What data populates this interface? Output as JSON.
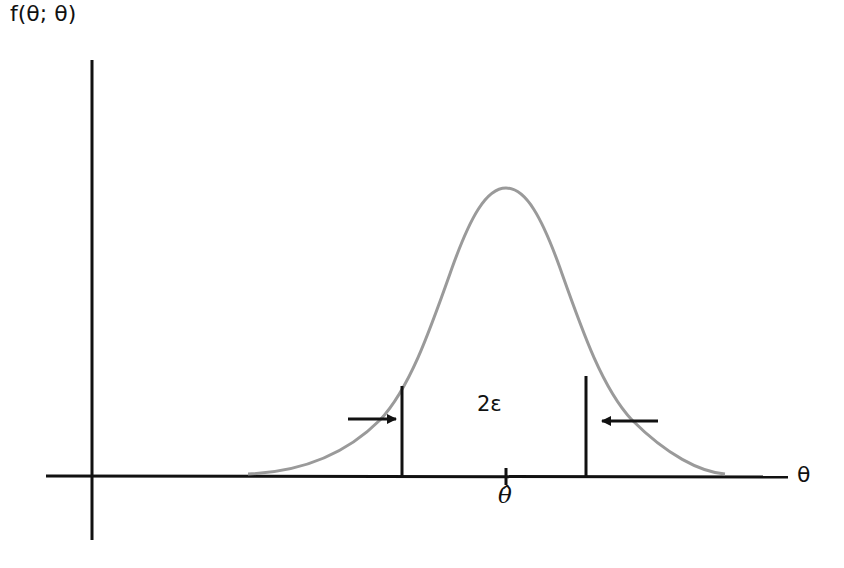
{
  "diagram": {
    "y_axis_label": "f(θ; θ)",
    "x_axis_label": "θ",
    "interval_label": "2ε",
    "estimate_label": "θ̂",
    "colors": {
      "axes": "#111111",
      "curve": "#9a9a9a",
      "background": "#ffffff"
    },
    "elements": {
      "curve": "bell-shaped density curve centered at θ̂",
      "bounds": [
        "left bound line",
        "right bound line"
      ],
      "arrows": [
        "right-pointing arrow toward left bound",
        "left-pointing arrow toward right bound"
      ],
      "tick": "tick mark at θ̂ on horizontal axis"
    }
  }
}
